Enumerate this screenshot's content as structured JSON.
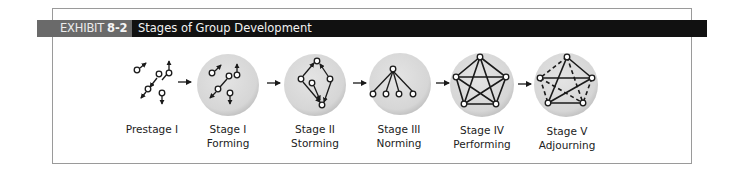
{
  "header": {
    "exhibit_label": "EXHIBIT",
    "exhibit_number": "8-2",
    "title": "Stages of Group Development"
  },
  "colors": {
    "header_black": "#111111",
    "header_grey": "#6a6a6a",
    "circle_fill": "#d9d9d9",
    "line": "#1a1a1a",
    "border": "#9a9a9a"
  },
  "stages": [
    {
      "line1": "Prestage I",
      "line2": "",
      "structure": "scattered individuals, no circle"
    },
    {
      "line1": "Stage I",
      "line2": "Forming",
      "structure": "scattered individuals with pairs"
    },
    {
      "line1": "Stage II",
      "line2": "Storming",
      "structure": "conflicting directed links"
    },
    {
      "line1": "Stage III",
      "line2": "Norming",
      "structure": "hierarchy: one leader, four members"
    },
    {
      "line1": "Stage IV",
      "line2": "Performing",
      "structure": "fully connected pentagon"
    },
    {
      "line1": "Stage V",
      "line2": "Adjourning",
      "structure": "pentagon with dashed dissolving links"
    }
  ]
}
